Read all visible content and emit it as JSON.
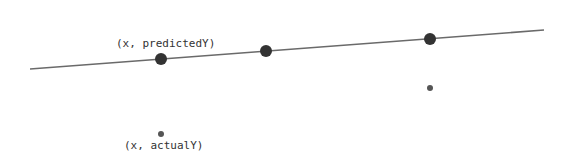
{
  "diagram": {
    "type": "regression-illustration",
    "colors": {
      "line": "#6a6a6a",
      "predicted_point": "#333333",
      "actual_point": "#555555",
      "label": "#333333"
    },
    "regression_line": {
      "x1": 30,
      "y1": 69,
      "x2": 544,
      "y2": 30
    },
    "predicted_points": [
      {
        "cx": 161,
        "cy": 59,
        "r": 6
      },
      {
        "cx": 266,
        "cy": 51,
        "r": 6
      },
      {
        "cx": 430,
        "cy": 39,
        "r": 6
      }
    ],
    "actual_points": [
      {
        "cx": 161,
        "cy": 134,
        "r": 3
      },
      {
        "cx": 430,
        "cy": 88,
        "r": 3
      }
    ],
    "labels": {
      "predicted": "(x, predictedY)",
      "actual": "(x, actualY)"
    }
  }
}
